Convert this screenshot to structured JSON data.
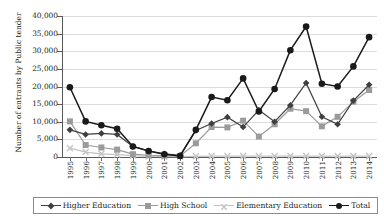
{
  "chart_data": {
    "type": "line",
    "title": "",
    "xlabel": "",
    "ylabel": "Number of entrants by Public tender",
    "ylim": [
      0,
      40000
    ],
    "ytick_labels": [
      "0",
      "5,000",
      "10,000",
      "15,000",
      "20,000",
      "25,000",
      "30,000",
      "35,000",
      "40,000"
    ],
    "yticks": [
      0,
      5000,
      10000,
      15000,
      20000,
      25000,
      30000,
      35000,
      40000
    ],
    "grid": "horizontal",
    "legend_position": "bottom",
    "categories": [
      "1995",
      "1996",
      "1997",
      "1998",
      "1999",
      "2000",
      "2001",
      "2002",
      "2003",
      "2004",
      "2005",
      "2006",
      "2007",
      "2008",
      "2009",
      "2010",
      "2011",
      "2012",
      "2013",
      "2014"
    ],
    "series": [
      {
        "name": "Higher Education",
        "marker": "diamond",
        "color": "#3f3f3f",
        "values": [
          7700,
          6400,
          6700,
          6400,
          3000,
          1700,
          900,
          500,
          7500,
          9500,
          11300,
          8500,
          13300,
          10000,
          14700,
          21000,
          11400,
          9300,
          16000,
          20500
        ]
      },
      {
        "name": "High School",
        "marker": "square",
        "color": "#9b9b9b",
        "values": [
          10100,
          3400,
          2700,
          2100,
          800,
          500,
          400,
          300,
          3900,
          8500,
          8400,
          10300,
          5800,
          9300,
          13700,
          13000,
          8700,
          11400,
          15700,
          19000
        ]
      },
      {
        "name": "Elementary Education",
        "marker": "cross",
        "color": "#c4c4c4",
        "values": [
          2500,
          1400,
          900,
          700,
          400,
          200,
          150,
          120,
          200,
          250,
          250,
          250,
          250,
          250,
          250,
          250,
          250,
          250,
          250,
          250
        ]
      },
      {
        "name": "Total",
        "marker": "circle",
        "color": "#1a1a1a",
        "values": [
          19800,
          10100,
          9000,
          8000,
          3000,
          1700,
          800,
          300,
          7700,
          17000,
          16100,
          22300,
          12900,
          19300,
          30300,
          37000,
          20800,
          20000,
          25700,
          34000
        ]
      }
    ]
  }
}
